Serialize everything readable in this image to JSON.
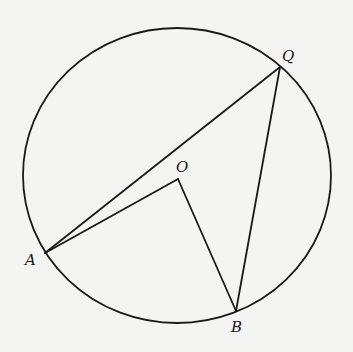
{
  "diagram": {
    "type": "circle-geometry",
    "colors": {
      "background": "#f4f4f3",
      "stroke": "#1a1a1a"
    },
    "circle": {
      "cx": 177,
      "cy": 175.5,
      "rx": 154,
      "ry": 147.5
    },
    "points": {
      "O": {
        "label": "O",
        "x": 178,
        "y": 179,
        "label_x": 176,
        "label_y": 172
      },
      "A": {
        "label": "A",
        "x": 45,
        "y": 253,
        "label_x": 25,
        "label_y": 265
      },
      "B": {
        "label": "B",
        "x": 236,
        "y": 311,
        "label_x": 231,
        "label_y": 332
      },
      "Q": {
        "label": "Q",
        "x": 280,
        "y": 67,
        "label_x": 282,
        "label_y": 61
      }
    },
    "segments": [
      {
        "name": "QA",
        "from": "Q",
        "to": "A"
      },
      {
        "name": "QB",
        "from": "Q",
        "to": "B"
      },
      {
        "name": "OA",
        "from": "O",
        "to": "A"
      },
      {
        "name": "OB",
        "from": "O",
        "to": "B"
      }
    ]
  }
}
